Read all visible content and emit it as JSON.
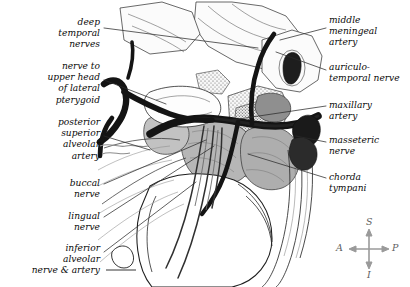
{
  "figure": {
    "background_color": "#ffffff",
    "ink_color": "#1a1a1a",
    "muscle_fill": "#b4b4b4",
    "bone_fill": "#efefef",
    "leader_color": "#2b2b2b",
    "compass_color": "#9a9a9a"
  },
  "labels_left": [
    {
      "id": "deep-temporal-nerves",
      "text": "deep\ntemporal\nnerves",
      "x": 8,
      "y": 17,
      "w": 92
    },
    {
      "id": "nerve-to-upper-head-of-lateral-pterygoid",
      "text": "nerve to\nupper head\nof lateral\npterygoid",
      "x": 8,
      "y": 61,
      "w": 92
    },
    {
      "id": "posterior-superior-alveolar-artery",
      "text": "posterior\nsuperior\nalveolar\nartery",
      "x": 8,
      "y": 117,
      "w": 92
    },
    {
      "id": "buccal-nerve",
      "text": "buccal\nnerve",
      "x": 8,
      "y": 178,
      "w": 92
    },
    {
      "id": "lingual-nerve",
      "text": "lingual\nnerve",
      "x": 8,
      "y": 211,
      "w": 92
    },
    {
      "id": "inferior-alveolar-nerve-and-artery",
      "text": "inferior\nalveolar\nnerve & artery",
      "x": 4,
      "y": 243,
      "w": 96
    }
  ],
  "labels_right": [
    {
      "id": "middle-meningeal-artery",
      "text": "middle\nmeningeal\nartery",
      "x": 329,
      "y": 15,
      "w": 80
    },
    {
      "id": "auriculo-temporal-nerve",
      "text": "auriculo-\ntemporal nerve",
      "x": 329,
      "y": 62,
      "w": 80
    },
    {
      "id": "maxillary-artery",
      "text": "maxillary\nartery",
      "x": 329,
      "y": 100,
      "w": 80
    },
    {
      "id": "masseteric-nerve",
      "text": "masseteric\nnerve",
      "x": 329,
      "y": 135,
      "w": 80
    },
    {
      "id": "chorda-tympani",
      "text": "chorda\ntympani",
      "x": 329,
      "y": 172,
      "w": 80
    }
  ],
  "compass": {
    "superior": "S",
    "inferior": "I",
    "anterior": "A",
    "posterior": "P",
    "center_x": 369,
    "center_y": 249
  }
}
